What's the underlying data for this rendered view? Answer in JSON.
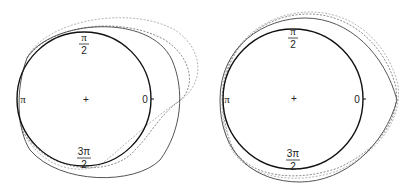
{
  "figure": {
    "panels": [
      {
        "id": "left",
        "labels": {
          "top_num": "π",
          "top_den": "2",
          "left": "π",
          "right": "0",
          "bottom_num": "3π",
          "bottom_den": "2",
          "center": "+"
        }
      },
      {
        "id": "right",
        "labels": {
          "top_num": "π",
          "top_den": "2",
          "left": "π",
          "right": "0",
          "bottom_num": "3π",
          "bottom_den": "2",
          "center": "+"
        }
      }
    ],
    "colors": {
      "base_circle": "#111111",
      "solid_curve": "#444444",
      "dashed_dark": "#888888",
      "dashed_light": "#b0b0b0"
    }
  }
}
